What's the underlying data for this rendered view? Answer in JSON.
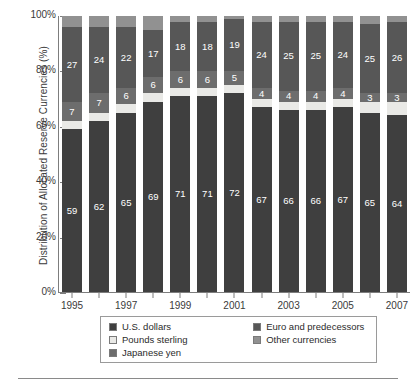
{
  "chart_data": {
    "type": "bar",
    "stacked": true,
    "title": "",
    "xlabel": "",
    "ylabel": "Distribution of Allocated Reserve Currencies (%)",
    "ylim": [
      0,
      100
    ],
    "ytick_labels": [
      "0%",
      "20%",
      "40%",
      "60%",
      "80%",
      "100%"
    ],
    "ytick_values": [
      0,
      20,
      40,
      60,
      80,
      100
    ],
    "grid": false,
    "legend_position": "bottom",
    "categories": [
      1995,
      1996,
      1997,
      1998,
      1999,
      2000,
      2001,
      2002,
      2003,
      2004,
      2005,
      2006,
      2007
    ],
    "xtick_labels": [
      "1995",
      "",
      "1997",
      "",
      "1999",
      "",
      "2001",
      "",
      "2003",
      "",
      "2005",
      "",
      "2007"
    ],
    "series": [
      {
        "name": "U.S. dollars",
        "color": "#3f3f3f",
        "values": [
          59,
          62,
          65,
          69,
          71,
          71,
          72,
          67,
          66,
          66,
          67,
          65,
          64
        ],
        "labels": [
          "59",
          "62",
          "65",
          "69",
          "71",
          "71",
          "72",
          "67",
          "66",
          "66",
          "67",
          "65",
          "64"
        ]
      },
      {
        "name": "Pounds sterling",
        "color": "#e9e9e6",
        "values": [
          3,
          3,
          3,
          3,
          3,
          3,
          3,
          3,
          3,
          3,
          3,
          4,
          5
        ],
        "labels": [
          "",
          "",
          "",
          "",
          "",
          "",
          "",
          "",
          "",
          "",
          "",
          "",
          ""
        ]
      },
      {
        "name": "Japanese yen",
        "color": "#6d6d6d",
        "values": [
          7,
          7,
          6,
          6,
          6,
          6,
          5,
          4,
          4,
          4,
          4,
          3,
          3
        ],
        "labels": [
          "7",
          "7",
          "6",
          "6",
          "6",
          "6",
          "5",
          "4",
          "4",
          "4",
          "4",
          "3",
          "3"
        ]
      },
      {
        "name": "Euro and predecessors",
        "color": "#575757",
        "values": [
          27,
          24,
          22,
          17,
          18,
          18,
          19,
          24,
          25,
          25,
          24,
          25,
          26
        ],
        "labels": [
          "27",
          "24",
          "22",
          "17",
          "18",
          "18",
          "19",
          "24",
          "25",
          "25",
          "24",
          "25",
          "26"
        ]
      },
      {
        "name": "Other currencies",
        "color": "#919191",
        "values": [
          4,
          4,
          4,
          5,
          2,
          2,
          1,
          2,
          2,
          2,
          2,
          3,
          2
        ],
        "labels": [
          "",
          "",
          "",
          "",
          "",
          "",
          "",
          "",
          "",
          "",
          "",
          "",
          ""
        ]
      }
    ]
  },
  "legend": {
    "columns": [
      {
        "items": [
          {
            "label": "U.S. dollars",
            "color": "#3f3f3f"
          },
          {
            "label": "Pounds sterling",
            "color": "#e9e9e6"
          },
          {
            "label": "Japanese yen",
            "color": "#6d6d6d"
          }
        ]
      },
      {
        "items": [
          {
            "label": "Euro and predecessors",
            "color": "#575757"
          },
          {
            "label": "Other currencies",
            "color": "#919191"
          }
        ]
      }
    ]
  }
}
